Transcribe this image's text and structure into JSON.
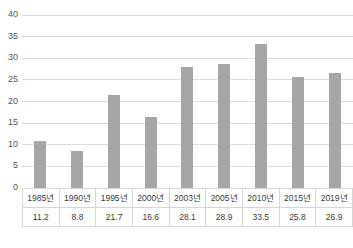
{
  "chart_data": {
    "type": "bar",
    "title": "",
    "subtitle": "",
    "xlabel": "",
    "ylabel": "",
    "categories": [
      "1985년",
      "1990년",
      "1995년",
      "2000년",
      "2003년",
      "2005년",
      "2010년",
      "2015년",
      "2019년"
    ],
    "values": [
      11.2,
      8.8,
      21.7,
      16.6,
      28.1,
      28.9,
      33.5,
      25.8,
      26.9
    ],
    "value_labels": [
      "11.2",
      "8.8",
      "21.7",
      "16.6",
      "28.1",
      "28.9",
      "33.5",
      "25.8",
      "26.9"
    ],
    "ylim": [
      0,
      40
    ],
    "ytick_values": [
      0,
      5,
      10,
      15,
      20,
      25,
      30,
      35,
      40
    ],
    "ytick_labels": [
      "0",
      "5",
      "10",
      "15",
      "20",
      "25",
      "30",
      "35",
      "40"
    ],
    "grid": true,
    "grid_axis": "y",
    "legend": false,
    "legend_position": "none",
    "bar_color": "#a6a6a6",
    "gridline_color": "#dcdcdc",
    "has_data_table": true,
    "series": [
      {
        "name": "",
        "values": [
          11.2,
          8.8,
          21.7,
          16.6,
          28.1,
          28.9,
          33.5,
          25.8,
          26.9
        ]
      }
    ]
  },
  "caption": {
    "text": "",
    "note": "clipped-at-image-edge"
  }
}
